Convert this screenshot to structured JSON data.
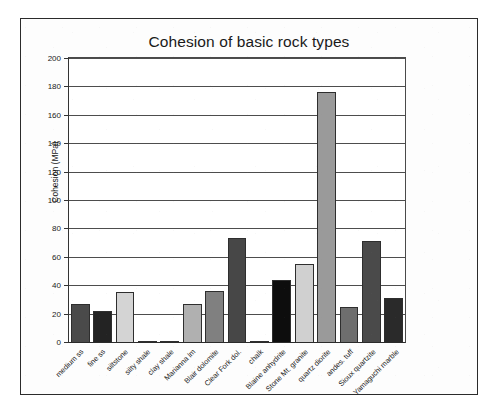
{
  "chart_data": {
    "type": "bar",
    "title": "Cohesion of basic rock types",
    "xlabel": "",
    "ylabel": "Cohesion (MPa)",
    "ylim": [
      0,
      200
    ],
    "ytick_step": 20,
    "yticks": [
      200,
      180,
      160,
      140,
      120,
      100,
      80,
      60,
      40,
      20,
      0
    ],
    "ytick_labels": [
      "200",
      "180",
      "160",
      "140",
      "120",
      "100",
      "80",
      "60",
      "40",
      "20",
      "0"
    ],
    "grid": true,
    "legend": false,
    "categories": [
      "medium ss",
      "fine ss",
      "siltstone",
      "silty shale",
      "clay shale",
      "Marianna lm",
      "Blair dolomite",
      "Clear Fork dol.",
      "chalk",
      "Blaine anhydrite",
      "Stone Mt. granite",
      "quartz diorite",
      "andes. tuff",
      "Sioux quartzite",
      "Yamaguchi marble"
    ],
    "values": [
      27,
      22,
      35,
      0.6,
      0.4,
      27,
      36,
      73,
      0.3,
      44,
      55,
      176,
      25,
      71,
      31
    ],
    "bar_colors": [
      "#4a4a4a",
      "#232323",
      "#d4d4d4",
      "#b8b8b8",
      "#b8b8b8",
      "#b0b0b0",
      "#808080",
      "#474747",
      "#fcfcfc",
      "#0d0d0d",
      "#d0d0d0",
      "#9a9a9a",
      "#6e6e6e",
      "#4a4a4a",
      "#2a2a2a"
    ],
    "bar_edge_color": "#2e2e2e",
    "axis_color": "#2b2b2b",
    "grid_color": "#4d4d4d",
    "background_color": "#ffffff",
    "frame_color": "#2b2b2b"
  }
}
